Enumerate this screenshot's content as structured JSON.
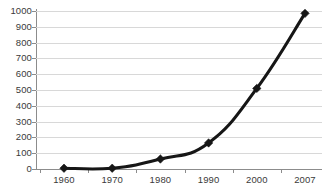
{
  "chart_data": {
    "type": "line",
    "title": "",
    "subtitle": "",
    "xlabel": "",
    "ylabel": "",
    "categories": [
      "1960",
      "1970",
      "1980",
      "1990",
      "2000",
      "2007"
    ],
    "values": [
      5,
      5,
      63,
      165,
      510,
      985
    ],
    "series": [
      {
        "name": "",
        "values": [
          5,
          5,
          63,
          165,
          510,
          985
        ]
      }
    ],
    "ylim": [
      0,
      1000
    ],
    "yticks": [
      0,
      100,
      200,
      300,
      400,
      500,
      600,
      700,
      800,
      900,
      1000
    ],
    "ytick_labels": [
      "0",
      "100",
      "200",
      "300",
      "400",
      "500",
      "600",
      "700",
      "800",
      "900",
      "1000"
    ],
    "xtick_labels": [
      "1960",
      "1970",
      "1980",
      "1990",
      "2000",
      "2007"
    ],
    "grid": "horizontal",
    "legend": "none",
    "marker": "diamond",
    "colors": {
      "line": "#161616",
      "marker": "#161616",
      "gridline": "#d8d8d8",
      "axis": "#8c8c8c",
      "text": "#3a3a3a",
      "background": "#ffffff"
    },
    "annotations": []
  }
}
